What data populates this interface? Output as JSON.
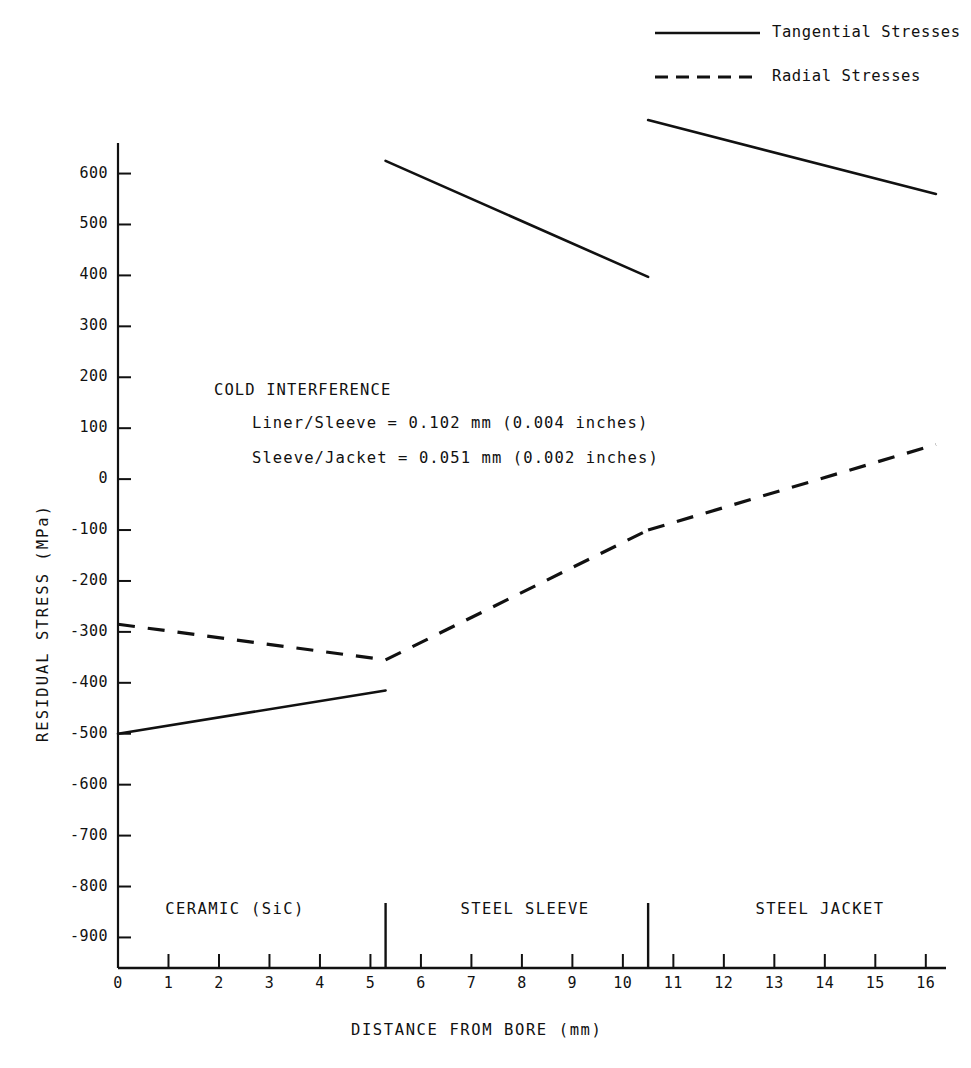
{
  "chart_data": {
    "type": "line",
    "title": "",
    "xlabel": "DISTANCE FROM BORE (mm)",
    "ylabel": "RESIDUAL STRESS (MPa)",
    "xlim": [
      0,
      16.4
    ],
    "ylim": [
      -960,
      660
    ],
    "xticks": [
      0,
      1,
      2,
      3,
      4,
      5,
      6,
      7,
      8,
      9,
      10,
      11,
      12,
      13,
      14,
      15,
      16
    ],
    "yticks": [
      600,
      500,
      400,
      300,
      200,
      100,
      0,
      -100,
      -200,
      -300,
      -400,
      -500,
      -600,
      -700,
      -800,
      -900
    ],
    "grid": false,
    "legend_position": "top-right",
    "series": [
      {
        "name": "Tangential Stresses",
        "style": "solid",
        "segments": [
          {
            "region": "CERAMIC (SiC)",
            "x": [
              0,
              5.3
            ],
            "y": [
              -500,
              -415
            ]
          },
          {
            "region": "STEEL SLEEVE",
            "x": [
              5.3,
              10.5
            ],
            "y": [
              625,
              397
            ]
          },
          {
            "region": "STEEL JACKET",
            "x": [
              10.5,
              16.2
            ],
            "y": [
              705,
              560
            ]
          }
        ]
      },
      {
        "name": "Radial Stresses",
        "style": "dashed",
        "segments": [
          {
            "region": "CERAMIC (SiC)",
            "x": [
              0,
              5.3
            ],
            "y": [
              -285,
              -355
            ]
          },
          {
            "region": "STEEL SLEEVE",
            "x": [
              5.3,
              10.5
            ],
            "y": [
              -355,
              -100
            ]
          },
          {
            "region": "STEEL JACKET",
            "x": [
              10.5,
              16.2
            ],
            "y": [
              -100,
              68
            ]
          }
        ]
      }
    ],
    "boundaries": [
      5.3,
      10.5
    ],
    "regions": [
      {
        "label": "CERAMIC (SiC)",
        "x_center": 2.65
      },
      {
        "label": "STEEL SLEEVE",
        "x_center": 7.9
      },
      {
        "label": "STEEL JACKET",
        "x_center": 13.3
      }
    ],
    "annotations": [
      "COLD INTERFERENCE",
      "Liner/Sleeve = 0.102 mm (0.004 inches)",
      "Sleeve/Jacket = 0.051 mm (0.002 inches)"
    ]
  },
  "legend": {
    "items": [
      {
        "label": "Tangential Stresses",
        "style": "solid"
      },
      {
        "label": "Radial Stresses",
        "style": "dashed"
      }
    ]
  },
  "axes": {
    "x_title": "DISTANCE FROM BORE (mm)",
    "y_title": "RESIDUAL STRESS (MPa)",
    "x_tick_labels": [
      "0",
      "1",
      "2",
      "3",
      "4",
      "5",
      "6",
      "7",
      "8",
      "9",
      "10",
      "11",
      "12",
      "13",
      "14",
      "15",
      "16"
    ],
    "y_tick_labels": [
      "600",
      "500",
      "400",
      "300",
      "200",
      "100",
      "0",
      "-100",
      "-200",
      "-300",
      "-400",
      "-500",
      "-600",
      "-700",
      "-800",
      "-900"
    ]
  },
  "annotation_block": {
    "heading": "COLD INTERFERENCE",
    "line1": "Liner/Sleeve = 0.102 mm (0.004 inches)",
    "line2": "Sleeve/Jacket = 0.051 mm (0.002 inches)"
  },
  "region_labels": {
    "ceramic": "CERAMIC (SiC)",
    "sleeve": "STEEL SLEEVE",
    "jacket": "STEEL JACKET"
  },
  "colors": {
    "ink": "#111111",
    "background": "#ffffff"
  }
}
